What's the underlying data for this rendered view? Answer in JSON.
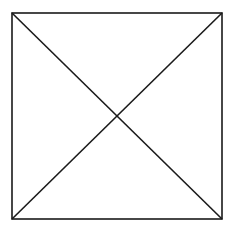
{
  "diagram": {
    "type": "square-with-diagonals",
    "canvas": {
      "width": 237,
      "height": 226
    },
    "square": {
      "x1": 12,
      "y1": 13,
      "x2": 222,
      "y2": 219
    },
    "stroke_color": "#1a1a1a",
    "background_color": "#ffffff",
    "stroke_width": 1.6,
    "diagonals": [
      {
        "from": [
          12,
          13
        ],
        "to": [
          222,
          219
        ]
      },
      {
        "from": [
          222,
          13
        ],
        "to": [
          12,
          219
        ]
      }
    ]
  }
}
